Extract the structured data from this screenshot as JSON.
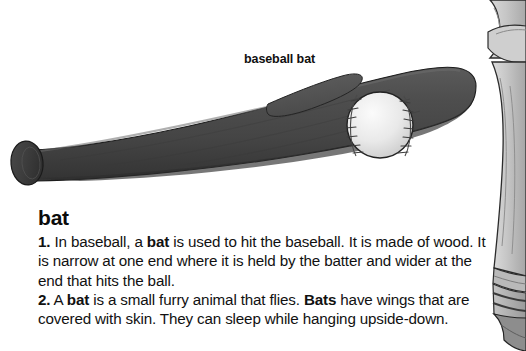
{
  "page": {
    "background_color": "#ffffff",
    "width": 526,
    "height": 351
  },
  "illustration": {
    "name": "baseball-bat-illustration",
    "callout_label": "baseball bat",
    "objects": [
      {
        "name": "baseball-bat",
        "color": "#4b4b4b",
        "outline": "#1e1e1e"
      },
      {
        "name": "baseball",
        "color": "#e4e4e4",
        "outline": "#2b2b2b",
        "seam_color": "#3a3a3a"
      },
      {
        "name": "baseball-player-leg",
        "color": "#c9c9c9",
        "outline": "#2b2b2b"
      }
    ]
  },
  "entry": {
    "headword": "bat",
    "senses": [
      {
        "number": "1.",
        "parts": [
          {
            "text": " In baseball, a ",
            "bold": false
          },
          {
            "text": "bat",
            "bold": true
          },
          {
            "text": " is used to hit the baseball. It is made of wood. It is narrow at one end where it is held by the batter and wider at the end that hits the ball.",
            "bold": false
          }
        ]
      },
      {
        "number": "2.",
        "parts": [
          {
            "text": " A ",
            "bold": false
          },
          {
            "text": "bat",
            "bold": true
          },
          {
            "text": " is a small furry animal that flies. ",
            "bold": false
          },
          {
            "text": "Bats",
            "bold": true
          },
          {
            "text": " have wings that are covered with skin. They can sleep while hanging upside-down.",
            "bold": false
          }
        ]
      }
    ]
  },
  "colors": {
    "text": "#111111",
    "bat_fill": "#4b4b4b",
    "bat_shade": "#3a3a3a",
    "ball_fill": "#e8e8e8",
    "figure_fill": "#c9c9c9",
    "background": "#ffffff"
  }
}
